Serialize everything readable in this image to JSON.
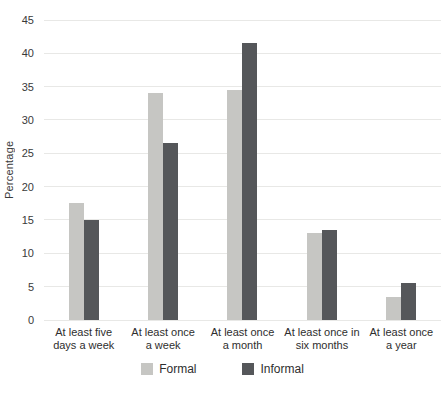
{
  "colors": {
    "background": "#ffffff",
    "gridline": "#e8e8e6",
    "text": "#333333",
    "formal_bar": "#c6c6c3",
    "informal_bar": "#55575a"
  },
  "chart_data": {
    "type": "bar",
    "title": "",
    "xlabel": "",
    "ylabel": "Percentage",
    "ylim": [
      0,
      45
    ],
    "yticks": [
      0,
      5,
      10,
      15,
      20,
      25,
      30,
      35,
      40,
      45
    ],
    "grid": "horizontal",
    "legend_position": "bottom",
    "categories": [
      "At least five\ndays a week",
      "At least once\na week",
      "At least once\na month",
      "At least once in\nsix months",
      "At least once\na year"
    ],
    "series": [
      {
        "name": "Formal",
        "color": "#c6c6c3",
        "values": [
          17.5,
          34,
          34.5,
          13,
          3.5
        ]
      },
      {
        "name": "Informal",
        "color": "#55575a",
        "values": [
          15,
          26.5,
          41.5,
          13.5,
          5.5
        ]
      }
    ]
  }
}
